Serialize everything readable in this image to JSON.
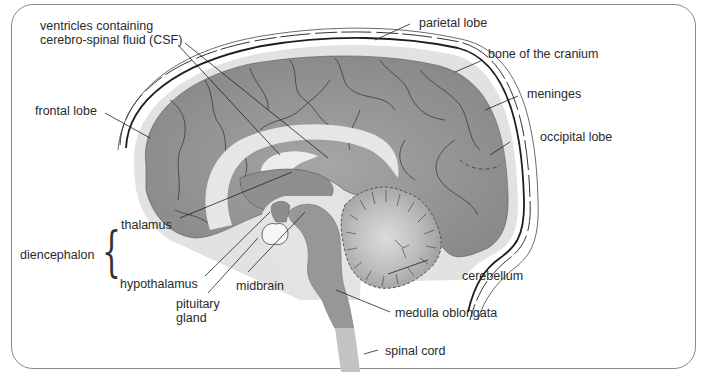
{
  "diagram": {
    "type": "anatomical-sagittal-section",
    "colors": {
      "cerebrum": "#8e8e8e",
      "cerebrum_light": "#b4b4b4",
      "csf": "#e4e4e4",
      "brainstem": "#9a9a9a",
      "spinal_cord": "#c2c2c2",
      "cerebellum_center": "#d9d9d9",
      "outline": "#333333",
      "label_text": "#2a2a2a"
    },
    "labels": {
      "ventricles_line1": "ventricles containing",
      "ventricles_line2": "cerebro-spinal fluid (CSF)",
      "parietal_lobe": "parietal lobe",
      "bone_cranium": "bone of the cranium",
      "meninges": "meninges",
      "frontal_lobe": "frontal lobe",
      "occipital_lobe": "occipital lobe",
      "thalamus": "thalamus",
      "diencephalon": "diencephalon",
      "hypothalamus": "hypothalamus",
      "midbrain": "midbrain",
      "pituitary_line1": "pituitary",
      "pituitary_line2": "gland",
      "cerebellum": "cerebellum",
      "medulla_oblongata": "medulla oblongata",
      "spinal_cord": "spinal cord"
    },
    "groupings": [
      {
        "group": "diencephalon",
        "members": [
          "thalamus",
          "hypothalamus"
        ],
        "marker": "brace"
      }
    ]
  }
}
